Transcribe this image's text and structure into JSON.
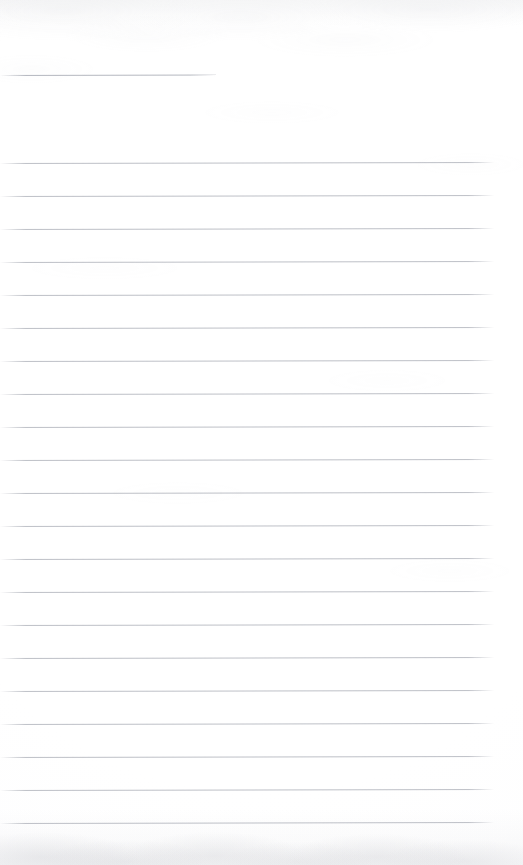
{
  "document": {
    "kind": "scanned-blank-ruled-page",
    "page_width": 523,
    "page_height": 865,
    "background_color": "#ffffff",
    "rule_color": "#969aa5",
    "edge_shade_color": "#a8aab2",
    "text_content": "",
    "visible_text_blocks": [],
    "notes_label": ""
  },
  "rules": {
    "line_spacing": 33,
    "left_margin": 0,
    "right_edge": 494,
    "skew_degrees": -0.13,
    "count": 22,
    "items": [
      {
        "id": "rule-header",
        "y": 75,
        "x_start": 0,
        "x_end": 216,
        "variant": "short"
      },
      {
        "id": "rule-01",
        "y": 163,
        "x_start": 0,
        "x_end": 494,
        "variant": "full"
      },
      {
        "id": "rule-02",
        "y": 196,
        "x_start": 0,
        "x_end": 494,
        "variant": "full"
      },
      {
        "id": "rule-03",
        "y": 229,
        "x_start": 0,
        "x_end": 494,
        "variant": "full"
      },
      {
        "id": "rule-04",
        "y": 262,
        "x_start": 0,
        "x_end": 494,
        "variant": "full"
      },
      {
        "id": "rule-05",
        "y": 295,
        "x_start": 0,
        "x_end": 494,
        "variant": "full"
      },
      {
        "id": "rule-06",
        "y": 328,
        "x_start": 0,
        "x_end": 494,
        "variant": "full"
      },
      {
        "id": "rule-07",
        "y": 361,
        "x_start": 0,
        "x_end": 494,
        "variant": "full"
      },
      {
        "id": "rule-08",
        "y": 394,
        "x_start": 0,
        "x_end": 494,
        "variant": "full"
      },
      {
        "id": "rule-09",
        "y": 427,
        "x_start": 0,
        "x_end": 494,
        "variant": "full"
      },
      {
        "id": "rule-10",
        "y": 460,
        "x_start": 0,
        "x_end": 494,
        "variant": "full"
      },
      {
        "id": "rule-11",
        "y": 493,
        "x_start": 0,
        "x_end": 494,
        "variant": "full"
      },
      {
        "id": "rule-12",
        "y": 526,
        "x_start": 0,
        "x_end": 494,
        "variant": "full"
      },
      {
        "id": "rule-13",
        "y": 559,
        "x_start": 0,
        "x_end": 494,
        "variant": "full"
      },
      {
        "id": "rule-14",
        "y": 592,
        "x_start": 0,
        "x_end": 494,
        "variant": "full"
      },
      {
        "id": "rule-15",
        "y": 625,
        "x_start": 0,
        "x_end": 494,
        "variant": "full"
      },
      {
        "id": "rule-16",
        "y": 658,
        "x_start": 0,
        "x_end": 494,
        "variant": "full"
      },
      {
        "id": "rule-17",
        "y": 691,
        "x_start": 0,
        "x_end": 494,
        "variant": "full"
      },
      {
        "id": "rule-18",
        "y": 724,
        "x_start": 0,
        "x_end": 494,
        "variant": "full"
      },
      {
        "id": "rule-19",
        "y": 757,
        "x_start": 0,
        "x_end": 494,
        "variant": "full"
      },
      {
        "id": "rule-20",
        "y": 790,
        "x_start": 0,
        "x_end": 494,
        "variant": "full"
      },
      {
        "id": "rule-21",
        "y": 823,
        "x_start": 0,
        "x_end": 494,
        "variant": "full"
      }
    ]
  }
}
